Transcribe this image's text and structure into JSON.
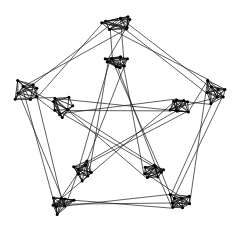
{
  "figure": {
    "background_color": "#ffffff",
    "edge_color": "#1a1a1a",
    "node_color": "#000000",
    "node_radius": 1.5,
    "edge_width": 0.7,
    "bundle_size": 3,
    "bundle_spread": 2.6
  },
  "chart_data": {
    "type": "graph",
    "xlabel": "",
    "ylabel": "",
    "grid": false,
    "legend": "none",
    "xlim": [
      0,
      238
    ],
    "ylim": [
      0,
      231
    ],
    "cluster_count": 10,
    "clusters": [
      {
        "id": "O0",
        "ring": "outer",
        "index": 0,
        "label": "top",
        "cx": 119,
        "cy": 22,
        "rx": 16,
        "ry": 9,
        "node_count": 8
      },
      {
        "id": "O1",
        "ring": "outer",
        "index": 1,
        "label": "upper-right",
        "cx": 214,
        "cy": 92,
        "rx": 12,
        "ry": 13,
        "node_count": 8
      },
      {
        "id": "O2",
        "ring": "outer",
        "index": 2,
        "label": "lower-right",
        "cx": 178,
        "cy": 203,
        "rx": 13,
        "ry": 11,
        "node_count": 8
      },
      {
        "id": "O3",
        "ring": "outer",
        "index": 3,
        "label": "lower-left",
        "cx": 60,
        "cy": 203,
        "rx": 13,
        "ry": 11,
        "node_count": 8
      },
      {
        "id": "O4",
        "ring": "outer",
        "index": 4,
        "label": "upper-left",
        "cx": 24,
        "cy": 92,
        "rx": 12,
        "ry": 13,
        "node_count": 8
      },
      {
        "id": "I0",
        "ring": "inner",
        "index": 0,
        "label": "inner-top",
        "cx": 119,
        "cy": 63,
        "rx": 14,
        "ry": 8,
        "node_count": 8
      },
      {
        "id": "I1",
        "ring": "inner",
        "index": 1,
        "label": "inner-upper-right",
        "cx": 178,
        "cy": 105,
        "rx": 11,
        "ry": 11,
        "node_count": 8
      },
      {
        "id": "I2",
        "ring": "inner",
        "index": 2,
        "label": "inner-lower-right",
        "cx": 155,
        "cy": 171,
        "rx": 12,
        "ry": 10,
        "node_count": 8
      },
      {
        "id": "I3",
        "ring": "inner",
        "index": 3,
        "label": "inner-lower-left",
        "cx": 84,
        "cy": 171,
        "rx": 12,
        "ry": 10,
        "node_count": 8
      },
      {
        "id": "I4",
        "ring": "inner",
        "index": 4,
        "label": "inner-upper-left",
        "cx": 61,
        "cy": 105,
        "rx": 11,
        "ry": 11,
        "node_count": 8
      }
    ],
    "edges": [
      {
        "from": "O0",
        "to": "O1",
        "kind": "outer-pentagon"
      },
      {
        "from": "O1",
        "to": "O2",
        "kind": "outer-pentagon"
      },
      {
        "from": "O2",
        "to": "O3",
        "kind": "outer-pentagon"
      },
      {
        "from": "O3",
        "to": "O4",
        "kind": "outer-pentagon"
      },
      {
        "from": "O4",
        "to": "O0",
        "kind": "outer-pentagon"
      },
      {
        "from": "O0",
        "to": "I0",
        "kind": "spoke"
      },
      {
        "from": "O1",
        "to": "I1",
        "kind": "spoke"
      },
      {
        "from": "O2",
        "to": "I2",
        "kind": "spoke"
      },
      {
        "from": "O3",
        "to": "I3",
        "kind": "spoke"
      },
      {
        "from": "O4",
        "to": "I4",
        "kind": "spoke"
      },
      {
        "from": "I0",
        "to": "I2",
        "kind": "inner-pentagram"
      },
      {
        "from": "I2",
        "to": "I4",
        "kind": "inner-pentagram"
      },
      {
        "from": "I4",
        "to": "I1",
        "kind": "inner-pentagram"
      },
      {
        "from": "I1",
        "to": "I3",
        "kind": "inner-pentagram"
      },
      {
        "from": "I3",
        "to": "I0",
        "kind": "inner-pentagram"
      }
    ]
  }
}
